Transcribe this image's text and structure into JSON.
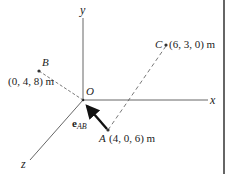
{
  "figure": {
    "type": "3D position vector diagram",
    "origin_label": "O",
    "axes": [
      {
        "name": "x",
        "label": "x"
      },
      {
        "name": "y",
        "label": "y"
      },
      {
        "name": "z",
        "label": "z"
      }
    ],
    "points": {
      "A": {
        "label": "A",
        "coords": "(4, 0, 6) m"
      },
      "B": {
        "label": "B",
        "coords": "(0, 4, 8) m"
      },
      "C": {
        "label": "C",
        "coords": "(6, 3, 0) m"
      }
    },
    "unit_vector": {
      "symbol": "e",
      "subscript": "AB",
      "direction": "from A toward B"
    },
    "dashed_lines": [
      "A–C",
      "B–O"
    ]
  },
  "colors": {
    "axis": "#555555",
    "dashed": "#555555",
    "arrow": "#111111",
    "text": "#222222",
    "border": "#333333"
  }
}
